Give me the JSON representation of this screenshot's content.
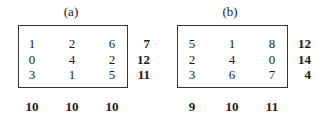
{
  "panels": [
    {
      "label": "(a)",
      "rows": [
        [
          "1",
          "2",
          "6"
        ],
        [
          "0",
          "4",
          "2"
        ],
        [
          "3",
          "1",
          "5"
        ]
      ],
      "row_sums": [
        "7",
        "12",
        "11"
      ],
      "col_sums": [
        "10",
        "10",
        "10"
      ]
    },
    {
      "label": "(b)",
      "rows": [
        [
          "5",
          "1",
          "8"
        ],
        [
          "2",
          "4",
          "0"
        ],
        [
          "3",
          "6",
          "7"
        ]
      ],
      "row_sums": [
        "12",
        "14",
        "4"
      ],
      "col_sums": [
        "9",
        "10",
        "11"
      ]
    }
  ]
}
